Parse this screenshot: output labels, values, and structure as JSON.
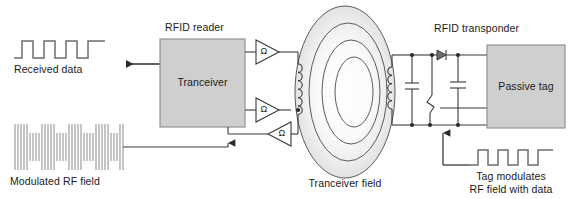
{
  "diagram": {
    "colors": {
      "box_fill": "#cfcfcf",
      "box_stroke": "#8c8c8c",
      "line": "#3a3a3a",
      "waveform": "#6e6e6e",
      "field_stroke": "#4a4a4a",
      "field_fill_outer": "#f2f2f2",
      "text": "#1a1a1a"
    },
    "labels": {
      "received_data": "Received data",
      "modulated_rf_field": "Modulated RF field",
      "rfid_reader": "RFID reader",
      "transceiver_box": "Tranceiver",
      "transceiver_field": "Tranceiver field",
      "rfid_transponder": "RFID transponder",
      "passive_tag": "Passive tag",
      "tag_modulates_line1": "Tag modulates",
      "tag_modulates_line2": "RF field with data"
    },
    "amplifiers": [
      {
        "symbol": "Ω",
        "name": "amplifier-top"
      },
      {
        "symbol": "Ω",
        "name": "amplifier-middle"
      },
      {
        "symbol": "Ω",
        "name": "amplifier-bottom"
      }
    ],
    "waveforms": {
      "received_data": {
        "type": "square-wave",
        "pulses": 4,
        "description": "Digital data square wave output from transceiver"
      },
      "modulated_rf_field": {
        "type": "amplitude-modulated-carrier",
        "description": "Dense RF carrier with amplitude modulation envelope"
      },
      "tag_modulated": {
        "type": "square-wave",
        "pulses": 4,
        "description": "Square wave of tag data modulating the RF field"
      }
    },
    "components": {
      "reader_coil": {
        "name": "inductor",
        "turns": 6
      },
      "tag_coil": {
        "name": "inductor",
        "turns": 6
      },
      "tuning_capacitor": {
        "name": "capacitor"
      },
      "smoothing_capacitor": {
        "name": "capacitor"
      },
      "rectifier_diode": {
        "name": "diode"
      },
      "modulation_transistor": {
        "name": "transistor-switch"
      }
    },
    "field_rings": 4
  }
}
